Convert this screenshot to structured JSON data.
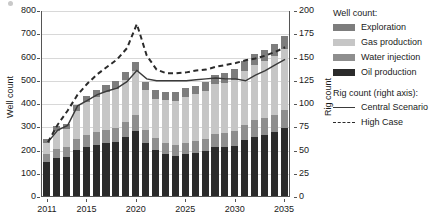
{
  "chart_data": {
    "type": "bar",
    "title": "",
    "xlabel": "",
    "ylabel": "Well count",
    "y2label": "Rig count",
    "ylim": [
      0,
      800
    ],
    "y2lim": [
      0,
      200
    ],
    "yticks": [
      0,
      100,
      200,
      300,
      400,
      500,
      600,
      700,
      800
    ],
    "y2ticks": [
      0,
      25,
      50,
      75,
      100,
      125,
      150,
      175,
      200
    ],
    "grid": true,
    "legend_position": "right",
    "categories": [
      2011,
      2012,
      2013,
      2014,
      2015,
      2016,
      2017,
      2018,
      2019,
      2020,
      2021,
      2022,
      2023,
      2024,
      2025,
      2026,
      2027,
      2028,
      2029,
      2030,
      2031,
      2032,
      2033,
      2034,
      2035
    ],
    "xticklabels": [
      "2011",
      "2015",
      "2020",
      "2025",
      "2030",
      "2035"
    ],
    "series": [
      {
        "name": "Oil production",
        "axis": "left",
        "color": "#2b2b2b",
        "values": [
          147,
          163,
          168,
          197,
          211,
          220,
          228,
          233,
          254,
          281,
          228,
          197,
          180,
          172,
          180,
          185,
          193,
          210,
          211,
          217,
          241,
          255,
          263,
          275,
          291
        ]
      },
      {
        "name": "Water injection",
        "axis": "left",
        "color": "#8e8e8e",
        "values": [
          35,
          38,
          42,
          48,
          52,
          55,
          58,
          60,
          64,
          68,
          58,
          52,
          50,
          48,
          50,
          52,
          54,
          58,
          60,
          62,
          66,
          70,
          72,
          74,
          78
        ]
      },
      {
        "name": "Gas production",
        "axis": "left",
        "color": "#c6c6c6",
        "values": [
          45,
          78,
          80,
          120,
          140,
          150,
          160,
          168,
          180,
          190,
          170,
          170,
          182,
          190,
          196,
          200,
          206,
          212,
          216,
          222,
          230,
          238,
          244,
          252,
          262
        ]
      },
      {
        "name": "Exploration",
        "axis": "left",
        "color": "#7d7d7d",
        "values": [
          18,
          22,
          22,
          27,
          29,
          31,
          33,
          35,
          36,
          39,
          35,
          35,
          35,
          36,
          38,
          38,
          39,
          40,
          42,
          44,
          45,
          47,
          49,
          54,
          57
        ]
      }
    ],
    "line_series": [
      {
        "name": "Central Scenario",
        "axis": "right",
        "style": "solid",
        "color": "#3a3a3a",
        "values": [
          59,
          72,
          77,
          98,
          104,
          110,
          114,
          117,
          124,
          136,
          127,
          125,
          125,
          125,
          125,
          126,
          127,
          128,
          127,
          127,
          125,
          131,
          136,
          142,
          148
        ]
      },
      {
        "name": "High Case",
        "axis": "right",
        "style": "dashed",
        "color": "#2b2b2b",
        "values": [
          59,
          78,
          93,
          110,
          122,
          132,
          140,
          148,
          160,
          186,
          152,
          137,
          133,
          133,
          134,
          136,
          137,
          140,
          142,
          144,
          147,
          149,
          152,
          156,
          161
        ]
      }
    ]
  },
  "legend": {
    "well_count_header": "Well count:",
    "well_items": [
      {
        "label": "Exploration",
        "color": "#7d7d7d"
      },
      {
        "label": "Gas production",
        "color": "#c6c6c6"
      },
      {
        "label": "Water injection",
        "color": "#8e8e8e"
      },
      {
        "label": "Oil production",
        "color": "#2b2b2b"
      }
    ],
    "rig_count_header": "Rig count (right axis):",
    "rig_items": [
      {
        "label": "Central Scenario",
        "style": "solid"
      },
      {
        "label": "High Case",
        "style": "dashed"
      }
    ]
  }
}
